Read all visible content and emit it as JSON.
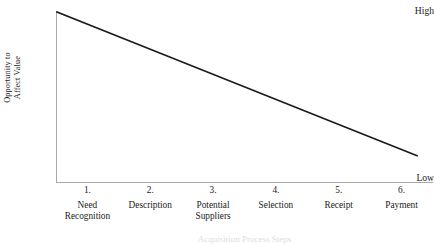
{
  "chart_data": {
    "type": "line",
    "title": "",
    "subtitle": "",
    "xlabel": "Acquisition Process Steps",
    "ylabel": "Opportunity to\nAffect Value",
    "categories": [
      "Need\nRecognition",
      "Description",
      "Potential\nSuppliers",
      "Selection",
      "Receipt",
      "Payment"
    ],
    "category_numbers": [
      "1.",
      "2.",
      "3.",
      "4.",
      "5.",
      "6."
    ],
    "x": [
      1,
      2,
      3,
      4,
      5,
      6
    ],
    "values": [
      100,
      83,
      66,
      49,
      32,
      15
    ],
    "ytick_labels": [
      "High",
      "Low"
    ],
    "ylim": [
      0,
      100
    ],
    "xlim": [
      0.5,
      6.5
    ],
    "grid": false,
    "legend": false,
    "legend_position": "none",
    "series": [
      {
        "name": "Opportunity to Affect Value",
        "values": [
          100,
          83,
          66,
          49,
          32,
          15
        ]
      }
    ],
    "annotations": []
  },
  "axis": {
    "y_title": "Opportunity to\nAffect Value",
    "y_high": "High",
    "y_low": "Low",
    "x_caption": "Acquisition Process Steps"
  },
  "steps": [
    {
      "number": "1.",
      "name": "Need\nRecognition"
    },
    {
      "number": "2.",
      "name": "Description"
    },
    {
      "number": "3.",
      "name": "Potential\nSuppliers"
    },
    {
      "number": "4.",
      "name": "Selection"
    },
    {
      "number": "5.",
      "name": "Receipt"
    },
    {
      "number": "6.",
      "name": "Payment"
    }
  ],
  "colors": {
    "line": "#1a1a1a",
    "axis": "#a8a8a8",
    "text": "#1a1a1a",
    "background": "#ffffff",
    "caption_faint": "#dddddd"
  }
}
